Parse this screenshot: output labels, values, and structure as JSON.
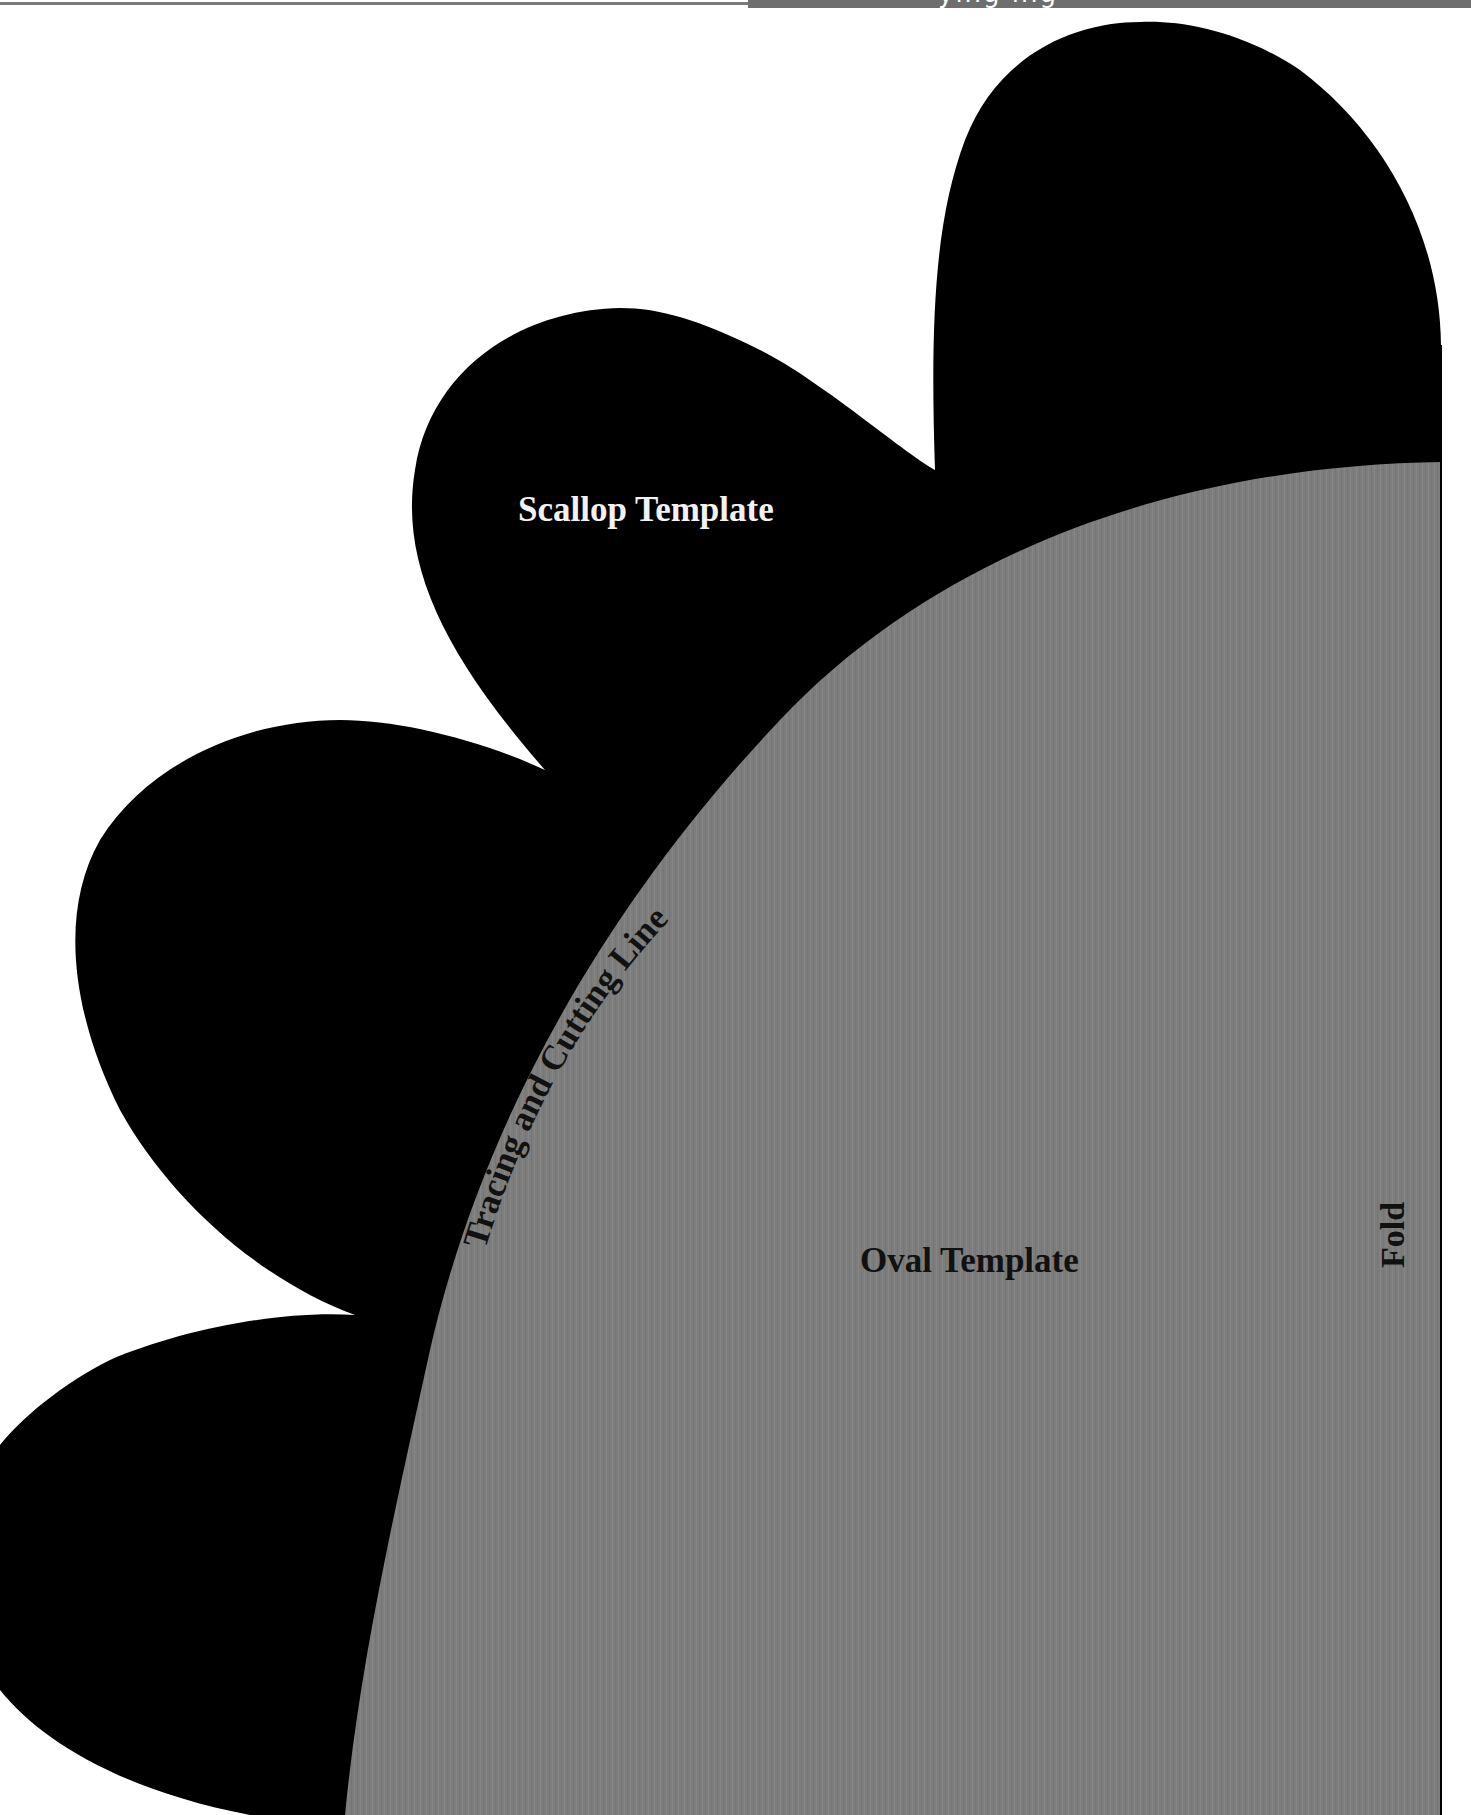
{
  "header": {
    "partial_title": "ying ing"
  },
  "templates": {
    "scallop": {
      "label": "Scallop Template",
      "fill_color": "#000000",
      "text_color": "#f2f2f2"
    },
    "oval": {
      "label": "Oval Template",
      "fill_color": "#7d7d7d",
      "text_color": "#111111"
    }
  },
  "annotations": {
    "tracing_line": "Tracing and Cutting Line",
    "fold": "Fold"
  },
  "colors": {
    "background": "#ffffff",
    "scallop": "#000000",
    "oval": "#7d7d7d",
    "header_bar": "#6e6e6e",
    "header_rule": "#7a7a7a"
  }
}
